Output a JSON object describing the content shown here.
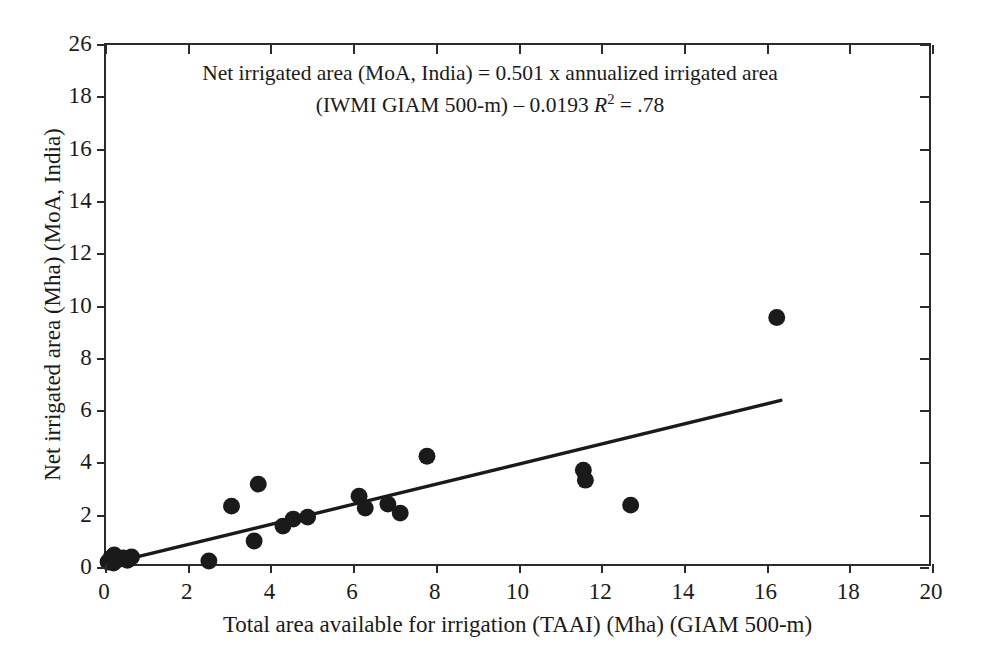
{
  "chart_data": {
    "type": "scatter",
    "title": "",
    "xlabel": "Total area available for irrigation (TAAI) (Mha) (GIAM 500-m)",
    "ylabel": "Net irrigated area (Mha) (MoA, India)",
    "xlim": [
      0,
      20
    ],
    "ylim": [
      0,
      26
    ],
    "xticks": [
      0,
      2,
      4,
      6,
      8,
      10,
      12,
      14,
      16,
      18,
      20
    ],
    "xtick_labels": [
      "0",
      "2",
      "4",
      "6",
      "8",
      "10",
      "12",
      "14",
      "16",
      "18",
      "20"
    ],
    "yticks": [
      0,
      2,
      4,
      6,
      8,
      10,
      12,
      14,
      16,
      18,
      26
    ],
    "ytick_labels": [
      "0",
      "2",
      "4",
      "6",
      "8",
      "10",
      "12",
      "14",
      "16",
      "18",
      "26"
    ],
    "grid": false,
    "legend": null,
    "marker_color": "#1a1a1a",
    "line_color": "#1a1a1a",
    "points": [
      {
        "x": 0.05,
        "y": 0.1
      },
      {
        "x": 0.12,
        "y": 0.3
      },
      {
        "x": 0.18,
        "y": 0.05
      },
      {
        "x": 0.3,
        "y": 0.22
      },
      {
        "x": 0.42,
        "y": 0.3
      },
      {
        "x": 0.52,
        "y": 0.18
      },
      {
        "x": 0.62,
        "y": 0.35
      },
      {
        "x": 0.2,
        "y": 0.45
      },
      {
        "x": 2.5,
        "y": 0.15
      },
      {
        "x": 3.05,
        "y": 2.9
      },
      {
        "x": 3.6,
        "y": 1.15
      },
      {
        "x": 3.7,
        "y": 4.0
      },
      {
        "x": 4.3,
        "y": 1.9
      },
      {
        "x": 4.55,
        "y": 2.25
      },
      {
        "x": 4.9,
        "y": 2.35
      },
      {
        "x": 6.15,
        "y": 3.4
      },
      {
        "x": 6.3,
        "y": 2.8
      },
      {
        "x": 6.85,
        "y": 3.0
      },
      {
        "x": 7.15,
        "y": 2.55
      },
      {
        "x": 7.8,
        "y": 5.4
      },
      {
        "x": 11.6,
        "y": 4.7
      },
      {
        "x": 11.65,
        "y": 4.2
      },
      {
        "x": 12.75,
        "y": 2.95
      },
      {
        "x": 16.3,
        "y": 12.35
      }
    ],
    "fit_line": {
      "slope": 0.501,
      "intercept": -0.0193,
      "r_squared": 0.78,
      "x_start": 0.0,
      "x_end": 16.4,
      "y_start": -0.0193,
      "y_end": 8.2
    },
    "annotation": {
      "line1": "Net irrigated area (MoA, India) = 0.501 x annualized irrigated area",
      "line2_pre": "(IWMI GIAM 500-m) – 0.0193 ",
      "line2_r": "R",
      "line2_sup": "2",
      "line2_post": " = .78"
    }
  }
}
